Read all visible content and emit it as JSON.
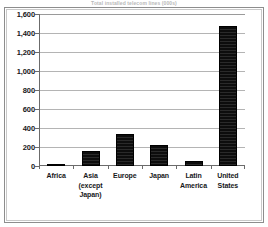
{
  "chart_data": {
    "type": "bar",
    "title": "Total installed telecom lines (000s)",
    "xlabel": "",
    "ylabel": "",
    "ylim": [
      0,
      1600
    ],
    "ytick_step": 200,
    "grid": true,
    "legend": "none",
    "categories": [
      "Africa",
      "Asia (except Japan)",
      "Europe",
      "Japan",
      "Latin America",
      "United States"
    ],
    "category_lines": [
      [
        "Africa"
      ],
      [
        "Asia",
        "(except",
        "Japan)"
      ],
      [
        "Europe"
      ],
      [
        "Japan"
      ],
      [
        "Latin",
        "America"
      ],
      [
        "United",
        "States"
      ]
    ],
    "values": [
      25,
      160,
      335,
      220,
      55,
      1470
    ],
    "ytick_labels": [
      "1,600",
      "1,400",
      "1,200",
      "1,000",
      "800",
      "600",
      "400",
      "200",
      "0"
    ],
    "ytick_values": [
      1600,
      1400,
      1200,
      1000,
      800,
      600,
      400,
      200,
      0
    ],
    "colors": {
      "bar": "#141414",
      "grid": "#b4b4b4",
      "axis": "#6b6b6b",
      "text": "#17181a",
      "plot_background": "#ffffff",
      "frame": "#8d8d8d",
      "title": "#b9b9b9"
    }
  }
}
